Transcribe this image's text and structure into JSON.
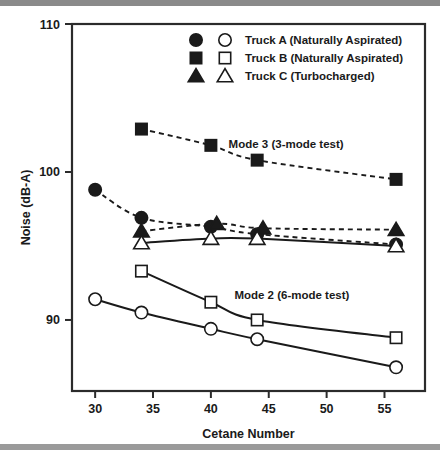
{
  "chart_data": {
    "type": "scatter",
    "title": "",
    "xlabel": "Cetane Number",
    "ylabel": "Noise (dB-A)",
    "xlim": [
      28,
      58.5
    ],
    "ylim": [
      85.2,
      110
    ],
    "xticks": [
      30,
      35,
      40,
      45,
      50,
      55
    ],
    "yticks": [
      90,
      100,
      110
    ],
    "grid": false,
    "legend_position": "top-center",
    "legend": [
      {
        "label": "Truck A (Naturally Aspirated)",
        "filled_marker": "circle",
        "open_marker": "circle"
      },
      {
        "label": "Truck B (Naturally Aspirated)",
        "filled_marker": "square",
        "open_marker": "square"
      },
      {
        "label": "Truck C (Turbocharged)",
        "filled_marker": "triangle",
        "open_marker": "triangle"
      }
    ],
    "annotations": [
      {
        "text": "Mode 3 (3-mode test)",
        "x": 46.5,
        "y": 101.6
      },
      {
        "text": "Mode 2 (6-mode test)",
        "x": 47.0,
        "y": 91.4
      }
    ],
    "series": [
      {
        "name": "Truck A Mode 3",
        "marker": "circle",
        "fill": "solid",
        "line": "dashed",
        "x": [
          30,
          34,
          40,
          44,
          56
        ],
        "y": [
          98.8,
          96.9,
          96.3,
          95.8,
          95.1
        ]
      },
      {
        "name": "Truck B Mode 3",
        "marker": "square",
        "fill": "solid",
        "line": "dashed",
        "x": [
          34,
          40,
          44,
          56
        ],
        "y": [
          102.9,
          101.8,
          100.8,
          99.5
        ]
      },
      {
        "name": "Truck C Mode 3",
        "marker": "triangle",
        "fill": "solid",
        "line": "dashed",
        "x": [
          34,
          40.5,
          44.5,
          56
        ],
        "y": [
          96.0,
          96.5,
          96.2,
          96.1
        ]
      },
      {
        "name": "Truck A Mode 2",
        "marker": "circle",
        "fill": "open",
        "line": "solid",
        "x": [
          30,
          34,
          40,
          44,
          56
        ],
        "y": [
          91.4,
          90.5,
          89.4,
          88.7,
          86.8
        ]
      },
      {
        "name": "Truck B Mode 2",
        "marker": "square",
        "fill": "open",
        "line": "solid",
        "x": [
          34,
          40,
          44,
          56
        ],
        "y": [
          93.3,
          91.2,
          90.0,
          88.8
        ]
      },
      {
        "name": "Truck C Mode 2",
        "marker": "triangle",
        "fill": "open",
        "line": "solid",
        "x": [
          34,
          40,
          44,
          56
        ],
        "y": [
          95.2,
          95.5,
          95.5,
          95.0
        ]
      }
    ]
  }
}
